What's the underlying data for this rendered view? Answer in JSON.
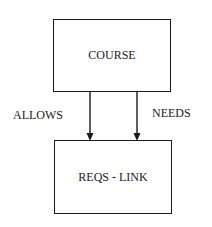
{
  "diagram": {
    "nodes": [
      {
        "id": "course",
        "label": "COURSE"
      },
      {
        "id": "reqs_link",
        "label": "REQS - LINK"
      }
    ],
    "edges": [
      {
        "from": "course",
        "to": "reqs_link",
        "label": "ALLOWS"
      },
      {
        "from": "course",
        "to": "reqs_link",
        "label": "NEEDS"
      }
    ]
  }
}
